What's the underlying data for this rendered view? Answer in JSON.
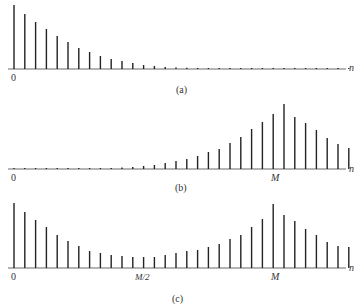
{
  "panels": [
    {
      "id": "a",
      "caption": "(a)",
      "origin_label": "0",
      "axis_label": "n",
      "baseline_y": 69,
      "marker_label": null,
      "values": [
        64,
        55,
        47,
        40,
        33,
        27,
        21,
        17,
        13,
        10,
        8,
        6,
        4,
        3,
        2,
        1.5,
        1.2,
        1,
        1,
        1,
        1,
        1,
        1,
        1,
        1,
        1,
        1,
        1,
        1,
        1,
        1,
        1
      ]
    },
    {
      "id": "b",
      "caption": "(b)",
      "origin_label": "0",
      "axis_label": "n",
      "baseline_y": 169,
      "marker_label": "M",
      "marker_index": 24,
      "values": [
        1,
        1,
        1,
        1,
        1,
        1,
        1,
        1,
        1,
        1,
        1.5,
        2,
        3,
        4,
        6,
        8,
        10,
        13,
        17,
        20,
        26,
        32,
        40,
        47,
        55,
        65,
        52,
        46,
        39,
        31,
        25,
        21
      ]
    },
    {
      "id": "c",
      "caption": "(c)",
      "origin_label": "0",
      "axis_label": "n",
      "baseline_y": 268,
      "marker_label": "M",
      "marker_index": 24,
      "mid_label": "M/2",
      "mid_index": 12,
      "values": [
        65,
        56,
        48,
        41,
        33,
        27,
        22,
        17,
        15,
        13,
        12,
        11,
        11,
        11,
        13,
        15,
        17,
        18,
        21,
        24,
        29,
        33,
        41,
        49,
        64,
        53,
        47,
        39,
        33,
        26,
        22,
        21
      ]
    }
  ],
  "chart_data": [
    {
      "type": "stem",
      "title": "(a)",
      "xlabel": "n",
      "x_start": 0,
      "values": [
        64,
        55,
        47,
        40,
        33,
        27,
        21,
        17,
        13,
        10,
        8,
        6,
        4,
        3,
        2,
        1.5,
        1.2,
        1,
        1,
        1,
        1,
        1,
        1,
        1,
        1,
        1,
        1,
        1,
        1,
        1,
        1,
        1
      ]
    },
    {
      "type": "stem",
      "title": "(b)",
      "xlabel": "n",
      "x_start": 0,
      "annotations": [
        {
          "x": 24,
          "label": "M"
        }
      ],
      "values": [
        1,
        1,
        1,
        1,
        1,
        1,
        1,
        1,
        1,
        1,
        1.5,
        2,
        3,
        4,
        6,
        8,
        10,
        13,
        17,
        20,
        26,
        32,
        40,
        47,
        55,
        65,
        52,
        46,
        39,
        31,
        25,
        21
      ]
    },
    {
      "type": "stem",
      "title": "(c)",
      "xlabel": "n",
      "x_start": 0,
      "annotations": [
        {
          "x": 12,
          "label": "M/2"
        },
        {
          "x": 24,
          "label": "M"
        }
      ],
      "values": [
        65,
        56,
        48,
        41,
        33,
        27,
        22,
        17,
        15,
        13,
        12,
        11,
        11,
        11,
        13,
        15,
        17,
        18,
        21,
        24,
        29,
        33,
        41,
        49,
        64,
        53,
        47,
        39,
        33,
        26,
        22,
        21
      ]
    }
  ]
}
